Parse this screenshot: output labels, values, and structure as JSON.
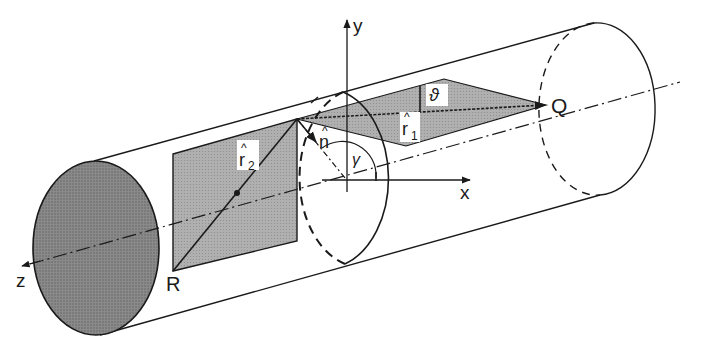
{
  "figure": {
    "colors": {
      "background": "#ffffff",
      "line": "#1a1a1a",
      "end_cap_fill": "#7a7a7a",
      "plane_fill": "#a8a8a8",
      "label_bg": "#ffffff"
    },
    "labels": {
      "y_axis": "y",
      "x_axis": "x",
      "z_axis": "z",
      "point_q": "Q",
      "point_r": "R",
      "theta": "ϑ",
      "gamma": "γ",
      "n_hat": "n",
      "r1_hat": "r",
      "r1_sub": "1",
      "r2_hat": "r",
      "r2_sub": "2",
      "hat": "^"
    }
  }
}
